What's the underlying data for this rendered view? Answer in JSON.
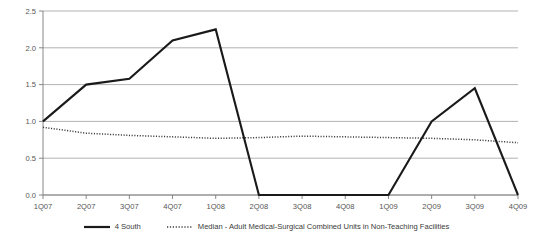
{
  "chart_data": {
    "type": "line",
    "title": "",
    "clipped_top_text": "",
    "xlabel": "",
    "ylabel": "",
    "categories": [
      "1Q07",
      "2Q07",
      "3Q07",
      "4Q07",
      "1Q08",
      "2Q08",
      "3Q08",
      "4Q08",
      "1Q09",
      "2Q09",
      "3Q09",
      "4Q09"
    ],
    "ylim": [
      0.0,
      2.5
    ],
    "yticks": [
      "0.0",
      "0.5",
      "1.0",
      "1.5",
      "2.0",
      "2.5"
    ],
    "ytick_values": [
      0.0,
      0.5,
      1.0,
      1.5,
      2.0,
      2.5
    ],
    "grid": "horizontal",
    "legend_position": "bottom-center",
    "series": [
      {
        "name": "4 South",
        "style": "solid",
        "color": "#1a1a1a",
        "values": [
          1.0,
          1.5,
          1.58,
          2.1,
          2.25,
          0.0,
          0.0,
          0.0,
          0.0,
          1.0,
          1.45,
          0.0
        ]
      },
      {
        "name": "Median - Adult Medical-Surgical Combined Units in Non-Teaching Facilities",
        "style": "dotted",
        "color": "#3a3a3a",
        "values": [
          0.92,
          0.84,
          0.81,
          0.79,
          0.77,
          0.78,
          0.8,
          0.79,
          0.78,
          0.77,
          0.75,
          0.71
        ]
      }
    ]
  },
  "legend": {
    "items": [
      {
        "label": "4 South",
        "style": "solid"
      },
      {
        "label": "Median - Adult Medical-Surgical Combined Units in Non-Teaching Facilities",
        "style": "dotted"
      }
    ]
  }
}
